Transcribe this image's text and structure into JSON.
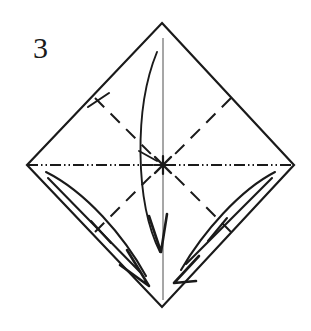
{
  "figure": {
    "kind": "origami-fold-diagram",
    "step_number": "3",
    "ink_color": "#1a1a1a",
    "paper_color": "#ffffff",
    "canvas": {
      "width": 311,
      "height": 331
    },
    "shape": {
      "name": "square-rotated-diamond",
      "top": {
        "x": 162,
        "y": 23
      },
      "right": {
        "x": 294,
        "y": 165
      },
      "bottom": {
        "x": 162,
        "y": 307
      },
      "left": {
        "x": 27,
        "y": 165
      }
    },
    "center_mark": {
      "x": 163,
      "y": 165,
      "label": "x-mark",
      "radius": 9
    },
    "axis_line": {
      "style": "dash-dot-dot",
      "orientation": "horizontal",
      "from": {
        "x": 27,
        "y": 165
      },
      "to": {
        "x": 294,
        "y": 165
      }
    },
    "vertical_axis": {
      "style": "thin-solid",
      "from": {
        "x": 163,
        "y": 38
      },
      "to": {
        "x": 163,
        "y": 300
      }
    },
    "valley_folds": [
      {
        "name": "valley-fold-upper-left",
        "from": {
          "x": 95,
          "y": 98
        },
        "to": {
          "x": 155,
          "y": 158
        }
      },
      {
        "name": "valley-fold-upper-right",
        "from": {
          "x": 231,
          "y": 98
        },
        "to": {
          "x": 171,
          "y": 158
        }
      },
      {
        "name": "valley-fold-lower-left",
        "from": {
          "x": 95,
          "y": 232
        },
        "to": {
          "x": 155,
          "y": 172
        }
      },
      {
        "name": "valley-fold-lower-right",
        "from": {
          "x": 231,
          "y": 232
        },
        "to": {
          "x": 171,
          "y": 172
        }
      }
    ],
    "fold_curves": [
      {
        "name": "center-fold-curve",
        "path": "M 157 52 C 135 110, 136 200, 160 250"
      },
      {
        "name": "left-edge-fold-curve",
        "path": "M 46 172 C 90 196, 128 240, 148 272"
      },
      {
        "name": "right-edge-fold-curve",
        "path": "M 275 172 C 236 196, 198 238, 178 268"
      }
    ],
    "arrows": [
      {
        "name": "center-down-arrow",
        "tip": {
          "x": 161,
          "y": 252
        },
        "direction": "down"
      },
      {
        "name": "left-down-right-arrow",
        "tip": {
          "x": 148,
          "y": 285
        },
        "direction": "down-right"
      },
      {
        "name": "right-down-left-arrow",
        "tip": {
          "x": 176,
          "y": 283
        },
        "direction": "down-left"
      }
    ],
    "tick_marks": [
      {
        "name": "tick-upper-left-fold",
        "from": {
          "x": 90,
          "y": 108
        },
        "to": {
          "x": 110,
          "y": 94
        }
      },
      {
        "name": "tick-lower-left-edge",
        "from": {
          "x": 93,
          "y": 222
        },
        "to": {
          "x": 110,
          "y": 243
        }
      },
      {
        "name": "tick-lower-right-edge",
        "from": {
          "x": 225,
          "y": 220
        },
        "to": {
          "x": 209,
          "y": 241
        }
      },
      {
        "name": "tick-center-curve",
        "from": {
          "x": 139,
          "y": 152
        },
        "to": {
          "x": 157,
          "y": 160
        }
      }
    ],
    "guide_lines": [
      {
        "name": "guide-left-inner-edge",
        "from": {
          "x": 46,
          "y": 172
        },
        "to": {
          "x": 152,
          "y": 280
        }
      },
      {
        "name": "guide-right-inner-edge",
        "from": {
          "x": 275,
          "y": 172
        },
        "to": {
          "x": 172,
          "y": 276
        }
      }
    ]
  }
}
